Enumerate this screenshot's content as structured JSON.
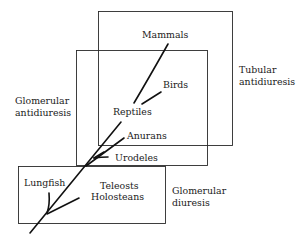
{
  "diagram": {
    "regions": {
      "tubular_antidiuresis": {
        "line1": "Tubular",
        "line2": "antidiuresis"
      },
      "glomerular_antidiuresis": {
        "line1": "Glomerular",
        "line2": "antidiuresis"
      },
      "glomerular_diuresis": {
        "line1": "Glomerular",
        "line2": "diuresis"
      }
    },
    "taxa": {
      "mammals": "Mammals",
      "birds": "Birds",
      "reptiles": "Reptiles",
      "anurans": "Anurans",
      "urodeles": "Urodeles",
      "lungfish": "Lungfish",
      "teleosts": "Teleosts",
      "holosteans": "Holosteans"
    }
  }
}
